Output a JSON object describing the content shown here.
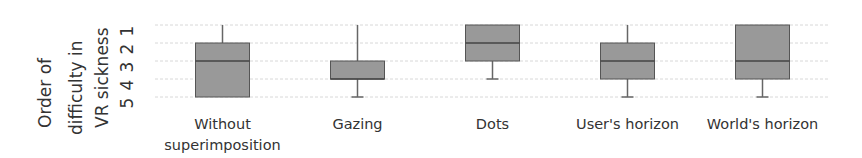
{
  "chart_data": {
    "type": "box",
    "title": "",
    "ylabel": "Order of difficulty in VR sickness",
    "ylabel_lines": [
      "Order of",
      "difficulty in",
      "VR sickness"
    ],
    "xlabel": "",
    "yticks": [
      1,
      2,
      3,
      4,
      5
    ],
    "ylim": [
      1,
      5
    ],
    "y_inverted": true,
    "grid": true,
    "categories": [
      "Without superimposition",
      "Gazing",
      "Dots",
      "User's horizon",
      "World's horizon"
    ],
    "category_lines": [
      [
        "Without",
        "superimposition"
      ],
      [
        "Gazing"
      ],
      [
        "Dots"
      ],
      [
        "User's horizon"
      ],
      [
        "World's horizon"
      ]
    ],
    "boxes": [
      {
        "min": 1,
        "q1": 2,
        "median": 3,
        "q3": 5,
        "max": 5
      },
      {
        "min": 1,
        "q1": 3,
        "median": 4,
        "q3": 4,
        "max": 5
      },
      {
        "min": 1,
        "q1": 1,
        "median": 2,
        "q3": 3,
        "max": 4
      },
      {
        "min": 1,
        "q1": 2,
        "median": 3,
        "q3": 4,
        "max": 5
      },
      {
        "min": 1,
        "q1": 1,
        "median": 3,
        "q3": 4,
        "max": 5
      }
    ],
    "colors": {
      "box_fill": "#999999",
      "box_stroke": "#555555",
      "grid": "#d8d8d8",
      "text": "#333333"
    }
  }
}
